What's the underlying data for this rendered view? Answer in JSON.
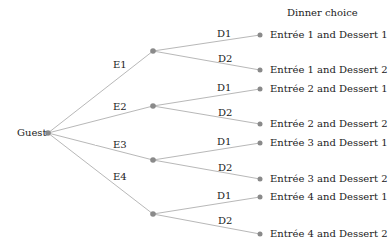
{
  "title": "Dinner choice",
  "root": {
    "label": "Guest",
    "x": 48,
    "y": 133
  },
  "colors": {
    "line": "#b8b8b8",
    "node": "#8a8a8a",
    "text": "#222222"
  },
  "entrees": [
    {
      "label": "E1",
      "x": 153,
      "y": 51,
      "label_x": 113,
      "label_y": 59,
      "branches": [
        {
          "label": "D1",
          "x": 260,
          "y": 35,
          "label_x": 217,
          "label_y": 28,
          "leaf": "Entrée 1 and Dessert 1"
        },
        {
          "label": "D2",
          "x": 260,
          "y": 70,
          "label_x": 218,
          "label_y": 53,
          "leaf": "Entrée 1 and Dessert 2"
        }
      ]
    },
    {
      "label": "E2",
      "x": 153,
      "y": 106,
      "label_x": 113,
      "label_y": 101,
      "branches": [
        {
          "label": "D1",
          "x": 260,
          "y": 89,
          "label_x": 217,
          "label_y": 82,
          "leaf": "Entrée 2 and Dessert 1"
        },
        {
          "label": "D2",
          "x": 260,
          "y": 124,
          "label_x": 218,
          "label_y": 107,
          "leaf": "Entrée 2 and Dessert 2"
        }
      ]
    },
    {
      "label": "E3",
      "x": 153,
      "y": 160,
      "label_x": 113,
      "label_y": 139,
      "branches": [
        {
          "label": "D1",
          "x": 260,
          "y": 143,
          "label_x": 217,
          "label_y": 136,
          "leaf": "Entrée 3 and Dessert 1"
        },
        {
          "label": "D2",
          "x": 260,
          "y": 179,
          "label_x": 218,
          "label_y": 162,
          "leaf": "Entrée 3 and Dessert 2"
        }
      ]
    },
    {
      "label": "E4",
      "x": 153,
      "y": 214,
      "label_x": 113,
      "label_y": 171,
      "branches": [
        {
          "label": "D1",
          "x": 260,
          "y": 197,
          "label_x": 217,
          "label_y": 190,
          "leaf": "Entrée 4 and Dessert 1"
        },
        {
          "label": "D2",
          "x": 260,
          "y": 234,
          "label_x": 218,
          "label_y": 215,
          "leaf": "Entrée 4 and Dessert 2"
        }
      ]
    }
  ]
}
